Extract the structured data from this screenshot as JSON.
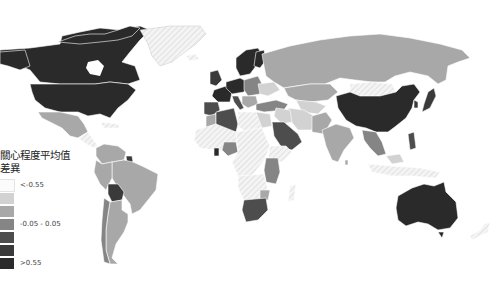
{
  "legend": {
    "title_line1": "關心程度平均值",
    "title_line2": "差異",
    "items": [
      {
        "color": "#fbfbfb",
        "label": "<-0.55"
      },
      {
        "color": "#d2d2d2",
        "label": ""
      },
      {
        "color": "#a8a8a8",
        "label": ""
      },
      {
        "color": "#858585",
        "label": "-0.05 - 0.05"
      },
      {
        "color": "#4d4d4d",
        "label": ""
      },
      {
        "color": "#3a3a3a",
        "label": ""
      },
      {
        "color": "#2a2a2a",
        "label": ">0.55"
      }
    ]
  },
  "map": {
    "background": "#ffffff",
    "no_data_pattern": "hatched",
    "colors": {
      "very_low": "#fbfbfb",
      "low": "#d2d2d2",
      "mid_low": "#a8a8a8",
      "mid": "#858585",
      "mid_high": "#4d4d4d",
      "high": "#3a3a3a",
      "very_high": "#2a2a2a"
    }
  }
}
